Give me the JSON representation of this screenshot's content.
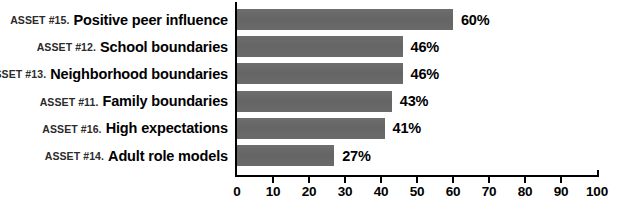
{
  "chart_data": {
    "type": "bar",
    "orientation": "horizontal",
    "title": "",
    "xlabel": "",
    "ylabel": "",
    "xlim": [
      0,
      100
    ],
    "grid": false,
    "legend": null,
    "value_suffix": "%",
    "categories": [
      "ASSET #15. Positive peer influence",
      "ASSET #12. School boundaries",
      "ASSET #13. Neighborhood boundaries",
      "ASSET #11. Family boundaries",
      "ASSET #16. High expectations",
      "ASSET #14. Adult role models"
    ],
    "values": [
      60,
      46,
      46,
      43,
      41,
      27
    ],
    "value_labels": [
      "60%",
      "46%",
      "46%",
      "43%",
      "41%",
      "27%"
    ],
    "ticks": [
      0,
      10,
      20,
      30,
      40,
      50,
      60,
      70,
      80,
      90,
      100
    ],
    "tick_labels": [
      "0",
      "10",
      "20",
      "30",
      "40",
      "50",
      "60",
      "70",
      "80",
      "90",
      "100"
    ],
    "bar_color": "#686868",
    "axis_color": "#000000",
    "text_color": "#000000",
    "background_color": "#ffffff"
  },
  "rows": [
    {
      "asset": "ASSET #15.",
      "name": "Positive peer influence",
      "value": 60,
      "value_label": "60%"
    },
    {
      "asset": "ASSET #12.",
      "name": "School boundaries",
      "value": 46,
      "value_label": "46%"
    },
    {
      "asset": "ASSET #13.",
      "name": "Neighborhood boundaries",
      "value": 46,
      "value_label": "46%"
    },
    {
      "asset": "ASSET #11.",
      "name": "Family boundaries",
      "value": 43,
      "value_label": "43%"
    },
    {
      "asset": "ASSET #16.",
      "name": "High expectations",
      "value": 41,
      "value_label": "41%"
    },
    {
      "asset": "ASSET #14.",
      "name": "Adult role models",
      "value": 27,
      "value_label": "27%"
    }
  ]
}
